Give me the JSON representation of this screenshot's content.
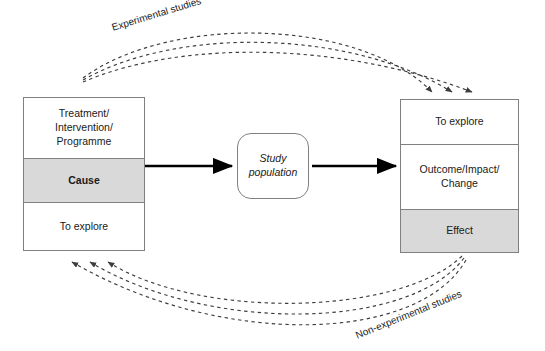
{
  "diagram": {
    "colors": {
      "shaded_band": "#d9d9d9",
      "box_border": "#808080",
      "solid_arrow": "#000000",
      "dashed_arrow": "#4d4d4d",
      "text": "#1a1a1a",
      "background": "#ffffff"
    },
    "left_box": {
      "name": "cause-box",
      "cells": [
        {
          "label": "Treatment/\nIntervention/\nProgramme",
          "shaded": false,
          "bold": false
        },
        {
          "label": "Cause",
          "shaded": true,
          "bold": true
        },
        {
          "label": "To explore",
          "shaded": false,
          "bold": false
        }
      ]
    },
    "center_node": {
      "name": "study-population-node",
      "label": "Study\npopulation",
      "italic": true
    },
    "right_box": {
      "name": "effect-box",
      "cells": [
        {
          "label": "To explore",
          "shaded": false,
          "bold": false
        },
        {
          "label": "Outcome/Impact/\nChange",
          "shaded": false,
          "bold": false
        },
        {
          "label": "Effect",
          "shaded": true,
          "bold": false
        }
      ]
    },
    "curve_labels": {
      "experimental": "Experimental studies",
      "non_experimental": "Non-experimental studies"
    },
    "flow_arrows": [
      {
        "from": "cause-box",
        "to": "study-population-node",
        "style": "solid"
      },
      {
        "from": "study-population-node",
        "to": "effect-box",
        "style": "solid"
      }
    ],
    "internal_arrows": [
      {
        "box": "cause-box",
        "direction": "up",
        "from_cell": "To explore",
        "to_cell": "Cause"
      },
      {
        "box": "cause-box",
        "direction": "up",
        "from_cell": "Cause",
        "to_cell": "Treatment/Intervention/Programme"
      },
      {
        "box": "effect-box",
        "direction": "down",
        "from_cell": "To explore",
        "to_cell": "Outcome/Impact/Change"
      },
      {
        "box": "effect-box",
        "direction": "down",
        "from_cell": "Outcome/Impact/Change",
        "to_cell": "Effect"
      }
    ]
  }
}
